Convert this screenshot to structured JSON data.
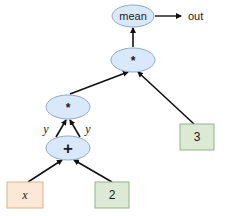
{
  "diagram": {
    "type": "computation-graph",
    "colors": {
      "op_fill": "#dae8fc",
      "op_stroke": "#8fa9c8",
      "input_fill": "#fbe8d6",
      "input_stroke": "#d6b38f",
      "const_fill": "#dcead5",
      "const_stroke": "#94b28a",
      "edge": "#111111"
    },
    "nodes": {
      "mean": {
        "label": "mean",
        "kind": "op"
      },
      "mul_top": {
        "label": "*",
        "kind": "op"
      },
      "mul_mid": {
        "label": "*",
        "kind": "op"
      },
      "add": {
        "label": "+",
        "kind": "op"
      },
      "x": {
        "label": "x",
        "kind": "input"
      },
      "two": {
        "label": "2",
        "kind": "constant"
      },
      "three": {
        "label": "3",
        "kind": "constant"
      }
    },
    "output": {
      "label": "out"
    },
    "edge_labels": {
      "left": "y",
      "right": "y"
    },
    "edges": [
      {
        "from": "x",
        "to": "add"
      },
      {
        "from": "two",
        "to": "add"
      },
      {
        "from": "add",
        "to": "mul_mid",
        "label": "y"
      },
      {
        "from": "add",
        "to": "mul_mid",
        "label": "y"
      },
      {
        "from": "mul_mid",
        "to": "mul_top"
      },
      {
        "from": "three",
        "to": "mul_top"
      },
      {
        "from": "mul_top",
        "to": "mean"
      },
      {
        "from": "mean",
        "to": "out"
      }
    ]
  }
}
